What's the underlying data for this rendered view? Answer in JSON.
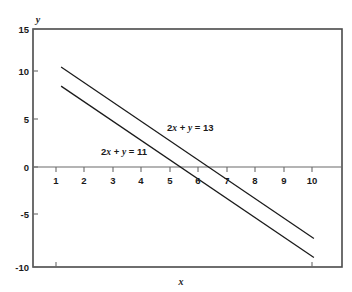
{
  "chart_data": {
    "type": "line",
    "title": "",
    "xlabel": "x",
    "ylabel": "y",
    "xlim": [
      0,
      11
    ],
    "ylim": [
      -10,
      15
    ],
    "grid": false,
    "legend": "inline-annotations",
    "x_ticks": [
      "1",
      "2",
      "3",
      "4",
      "5",
      "6",
      "7",
      "8",
      "9",
      "10"
    ],
    "x_tick_values": [
      1,
      2,
      3,
      4,
      5,
      6,
      7,
      8,
      9,
      10
    ],
    "y_ticks": [
      "15",
      "10",
      "5",
      "0",
      "-5",
      "-10"
    ],
    "y_tick_values": [
      15,
      10,
      5,
      0,
      -5,
      -10
    ],
    "series": [
      {
        "name": "2x + y = 13",
        "label_prefix": "2",
        "label_x_sym": "x",
        "label_mid": " + ",
        "label_y_sym": "y",
        "label_suffix": " = 13",
        "x": [
          1,
          10
        ],
        "values": [
          11,
          -7
        ],
        "slope": -2,
        "intercept": 13,
        "x_intercept": 6.5,
        "label_pos": {
          "x": 6.0,
          "y": 3.5
        }
      },
      {
        "name": "2x + y = 11",
        "label_prefix": "2",
        "label_x_sym": "x",
        "label_mid": " + ",
        "label_y_sym": "y",
        "label_suffix": " = 11",
        "x": [
          1,
          10
        ],
        "values": [
          9,
          -9
        ],
        "slope": -2,
        "intercept": 11,
        "x_intercept": 5.5,
        "label_pos": {
          "x": 3.4,
          "y": 1.3
        }
      }
    ],
    "colors": {
      "background": "#ffffff",
      "line": "#1a1a1a",
      "frame": "#4a4a4a",
      "axis": "#6a6a6a",
      "text": "#1a1a1a"
    }
  }
}
